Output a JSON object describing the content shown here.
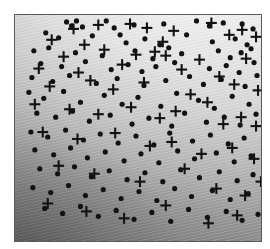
{
  "figure": {
    "title": "",
    "background_color": "#ffffff",
    "panel": {
      "border_color": "#5a5a5a",
      "x": 14,
      "y": 14,
      "width": 248,
      "height": 228,
      "background_description": "grayscale gradient, bright upper-right, dark lower-left, faint diagonal striping"
    }
  },
  "chart_data": {
    "type": "scatter",
    "title": "",
    "xlabel": "",
    "ylabel": "",
    "xlim": [
      0,
      248
    ],
    "ylim": [
      0,
      228
    ],
    "grid": false,
    "legend_position": "none",
    "axis_ticks": false,
    "marker_colors": {
      "dot": "#121212",
      "plus": "#121212"
    },
    "series": [
      {
        "name": "dot",
        "marker": "filled-circle",
        "marker_size": 4,
        "count": 148,
        "points": [
          [
            52,
            7
          ],
          [
            57,
            11
          ],
          [
            62,
            6
          ],
          [
            68,
            12
          ],
          [
            92,
            6
          ],
          [
            100,
            13
          ],
          [
            120,
            10
          ],
          [
            150,
            9
          ],
          [
            183,
            6
          ],
          [
            196,
            11
          ],
          [
            210,
            8
          ],
          [
            229,
            9
          ],
          [
            240,
            14
          ],
          [
            31,
            18
          ],
          [
            44,
            23
          ],
          [
            78,
            21
          ],
          [
            106,
            20
          ],
          [
            112,
            28
          ],
          [
            131,
            24
          ],
          [
            146,
            30
          ],
          [
            173,
            20
          ],
          [
            199,
            27
          ],
          [
            222,
            24
          ],
          [
            234,
            30
          ],
          [
            19,
            36
          ],
          [
            34,
            33
          ],
          [
            61,
            38
          ],
          [
            88,
            41
          ],
          [
            121,
            36
          ],
          [
            139,
            44
          ],
          [
            155,
            33
          ],
          [
            168,
            39
          ],
          [
            205,
            36
          ],
          [
            217,
            43
          ],
          [
            228,
            38
          ],
          [
            238,
            34
          ],
          [
            26,
            49
          ],
          [
            47,
            52
          ],
          [
            71,
            47
          ],
          [
            97,
            55
          ],
          [
            114,
            50
          ],
          [
            128,
            57
          ],
          [
            142,
            52
          ],
          [
            161,
            48
          ],
          [
            196,
            54
          ],
          [
            213,
            51
          ],
          [
            226,
            58
          ],
          [
            241,
            48
          ],
          [
            17,
            63
          ],
          [
            38,
            67
          ],
          [
            55,
            61
          ],
          [
            82,
            69
          ],
          [
            103,
            64
          ],
          [
            130,
            71
          ],
          [
            152,
            66
          ],
          [
            176,
            62
          ],
          [
            190,
            70
          ],
          [
            208,
            65
          ],
          [
            232,
            72
          ],
          [
            244,
            61
          ],
          [
            14,
            78
          ],
          [
            29,
            84
          ],
          [
            49,
            77
          ],
          [
            66,
            88
          ],
          [
            90,
            81
          ],
          [
            108,
            90
          ],
          [
            124,
            83
          ],
          [
            147,
            92
          ],
          [
            163,
            79
          ],
          [
            185,
            86
          ],
          [
            201,
            94
          ],
          [
            219,
            82
          ],
          [
            236,
            90
          ],
          [
            22,
            99
          ],
          [
            41,
            103
          ],
          [
            58,
            97
          ],
          [
            75,
            107
          ],
          [
            96,
            101
          ],
          [
            118,
            110
          ],
          [
            135,
            104
          ],
          [
            158,
            112
          ],
          [
            171,
            99
          ],
          [
            193,
            108
          ],
          [
            211,
            103
          ],
          [
            227,
            111
          ],
          [
            243,
            100
          ],
          [
            16,
            118
          ],
          [
            33,
            123
          ],
          [
            51,
            116
          ],
          [
            69,
            126
          ],
          [
            86,
            120
          ],
          [
            104,
            129
          ],
          [
            122,
            122
          ],
          [
            140,
            131
          ],
          [
            156,
            119
          ],
          [
            179,
            127
          ],
          [
            197,
            121
          ],
          [
            215,
            130
          ],
          [
            231,
            124
          ],
          [
            20,
            136
          ],
          [
            39,
            141
          ],
          [
            56,
            134
          ],
          [
            73,
            144
          ],
          [
            91,
            138
          ],
          [
            110,
            147
          ],
          [
            127,
            140
          ],
          [
            145,
            149
          ],
          [
            164,
            137
          ],
          [
            181,
            145
          ],
          [
            203,
            139
          ],
          [
            221,
            148
          ],
          [
            238,
            142
          ],
          [
            25,
            155
          ],
          [
            43,
            160
          ],
          [
            60,
            153
          ],
          [
            77,
            163
          ],
          [
            95,
            157
          ],
          [
            113,
            166
          ],
          [
            131,
            159
          ],
          [
            149,
            168
          ],
          [
            167,
            156
          ],
          [
            186,
            164
          ],
          [
            206,
            158
          ],
          [
            224,
            167
          ],
          [
            240,
            161
          ],
          [
            18,
            174
          ],
          [
            36,
            179
          ],
          [
            54,
            172
          ],
          [
            71,
            182
          ],
          [
            89,
            176
          ],
          [
            107,
            185
          ],
          [
            125,
            178
          ],
          [
            143,
            187
          ],
          [
            161,
            175
          ],
          [
            178,
            183
          ],
          [
            199,
            177
          ],
          [
            217,
            186
          ],
          [
            235,
            180
          ],
          [
            30,
            195
          ],
          [
            48,
            200
          ],
          [
            66,
            193
          ],
          [
            84,
            203
          ],
          [
            102,
            197
          ],
          [
            120,
            206
          ],
          [
            138,
            199
          ],
          [
            157,
            208
          ],
          [
            175,
            196
          ],
          [
            194,
            204
          ],
          [
            213,
            198
          ],
          [
            229,
            207
          ],
          [
            245,
            201
          ]
        ]
      },
      {
        "name": "plus",
        "marker": "plus",
        "marker_size": 11,
        "count": 52,
        "points": [
          [
            59,
            14
          ],
          [
            84,
            10
          ],
          [
            116,
            9
          ],
          [
            149,
            27
          ],
          [
            198,
            8
          ],
          [
            216,
            20
          ],
          [
            243,
            22
          ],
          [
            37,
            25
          ],
          [
            70,
            30
          ],
          [
            133,
            13
          ],
          [
            160,
            16
          ],
          [
            229,
            15
          ],
          [
            49,
            42
          ],
          [
            90,
            35
          ],
          [
            122,
            40
          ],
          [
            141,
            37
          ],
          [
            152,
            41
          ],
          [
            186,
            45
          ],
          [
            233,
            44
          ],
          [
            24,
            54
          ],
          [
            64,
            58
          ],
          [
            108,
            50
          ],
          [
            168,
            55
          ],
          [
            206,
            62
          ],
          [
            221,
            70
          ],
          [
            35,
            72
          ],
          [
            76,
            66
          ],
          [
            99,
            75
          ],
          [
            130,
            68
          ],
          [
            177,
            80
          ],
          [
            194,
            88
          ],
          [
            245,
            76
          ],
          [
            20,
            90
          ],
          [
            55,
            95
          ],
          [
            84,
            100
          ],
          [
            117,
            93
          ],
          [
            146,
            104
          ],
          [
            162,
            97
          ],
          [
            210,
            110
          ],
          [
            228,
            103
          ],
          [
            243,
            112
          ],
          [
            28,
            118
          ],
          [
            63,
            125
          ],
          [
            101,
            119
          ],
          [
            136,
            132
          ],
          [
            158,
            128
          ],
          [
            188,
            140
          ],
          [
            219,
            134
          ],
          [
            241,
            145
          ],
          [
            44,
            152
          ],
          [
            80,
            160
          ],
          [
            126,
            168
          ],
          [
            171,
            155
          ],
          [
            203,
            175
          ],
          [
            232,
            182
          ],
          [
            248,
            168
          ],
          [
            33,
            190
          ],
          [
            72,
            198
          ],
          [
            110,
            205
          ],
          [
            152,
            192
          ],
          [
            195,
            210
          ],
          [
            224,
            202
          ]
        ]
      }
    ]
  }
}
